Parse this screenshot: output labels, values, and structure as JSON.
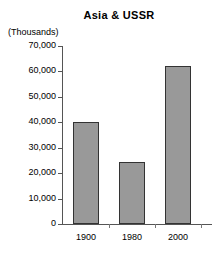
{
  "chart_data": {
    "type": "bar",
    "title": "Asia & USSR",
    "xlabel": "",
    "ylabel": "(Thousands)",
    "categories": [
      "1900",
      "1980",
      "2000"
    ],
    "values": [
      40000,
      24500,
      62000
    ],
    "ylim": [
      0,
      70000
    ],
    "ytick_values": [
      0,
      10000,
      20000,
      30000,
      40000,
      50000,
      60000,
      70000
    ],
    "ytick_labels": [
      "0",
      "10,000",
      "20,000",
      "30,000",
      "40,000",
      "50,000",
      "60,000",
      "70,000"
    ],
    "grid": false,
    "legend": null,
    "bar_color": "#999999",
    "bar_border_color": "#333333",
    "axis_color": "#555555",
    "background": "#ffffff"
  }
}
